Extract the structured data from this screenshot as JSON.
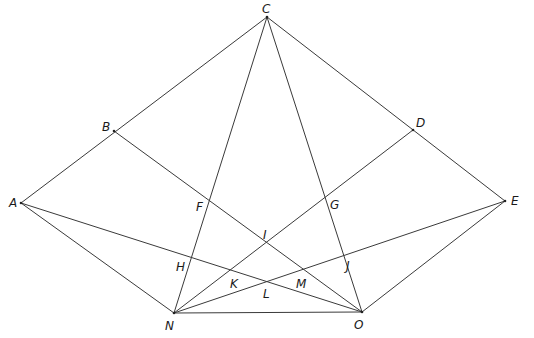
{
  "diagram": {
    "type": "geometry-construction",
    "points": [
      {
        "id": "A",
        "label": "A",
        "x": 21,
        "y": 203,
        "lx": 9,
        "ly": 207
      },
      {
        "id": "B",
        "label": "B",
        "x": 114,
        "y": 131,
        "lx": 102,
        "ly": 131
      },
      {
        "id": "C",
        "label": "C",
        "x": 267,
        "y": 17,
        "lx": 262,
        "ly": 13
      },
      {
        "id": "D",
        "label": "D",
        "x": 413,
        "y": 130,
        "lx": 416,
        "ly": 127
      },
      {
        "id": "E",
        "label": "E",
        "x": 505,
        "y": 201,
        "lx": 511,
        "ly": 205
      },
      {
        "id": "F",
        "label": "F",
        "x": 206,
        "y": 200,
        "lx": 196,
        "ly": 211
      },
      {
        "id": "G",
        "label": "G",
        "x": 320,
        "y": 199,
        "lx": 330,
        "ly": 209
      },
      {
        "id": "H",
        "label": "H",
        "x": 188,
        "y": 259,
        "lx": 176,
        "ly": 271
      },
      {
        "id": "I",
        "label": "I",
        "x": 264,
        "y": 243,
        "lx": 263,
        "ly": 239
      },
      {
        "id": "J",
        "label": "J",
        "x": 339,
        "y": 258,
        "lx": 346,
        "ly": 270
      },
      {
        "id": "K",
        "label": "K",
        "x": 228,
        "y": 270,
        "lx": 230,
        "ly": 288
      },
      {
        "id": "L",
        "label": "L",
        "x": 270,
        "y": 283,
        "lx": 263,
        "ly": 298
      },
      {
        "id": "M",
        "label": "M",
        "x": 299,
        "y": 270,
        "lx": 296,
        "ly": 288
      },
      {
        "id": "N",
        "label": "N",
        "x": 174,
        "y": 313,
        "lx": 165,
        "ly": 330
      },
      {
        "id": "O",
        "label": "O",
        "x": 362,
        "y": 312,
        "lx": 354,
        "ly": 329
      }
    ],
    "segments": [
      [
        "A",
        "C"
      ],
      [
        "C",
        "E"
      ],
      [
        "A",
        "N"
      ],
      [
        "E",
        "O"
      ],
      [
        "N",
        "O"
      ],
      [
        "C",
        "N"
      ],
      [
        "C",
        "O"
      ],
      [
        "B",
        "O"
      ],
      [
        "D",
        "N"
      ],
      [
        "A",
        "O"
      ],
      [
        "E",
        "N"
      ]
    ],
    "stroke_color": "#3a3a3a",
    "background": "#ffffff"
  }
}
